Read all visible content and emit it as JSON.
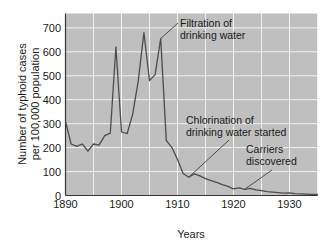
{
  "chart_data": {
    "type": "line",
    "title": "",
    "xlabel": "Years",
    "ylabel": "Number of typhoid cases per 100,000 population",
    "ylabel_line1": "Number of typhoid cases",
    "ylabel_line2": "per 100,000 population",
    "xlim": [
      1890,
      1935
    ],
    "ylim": [
      0,
      760
    ],
    "grid": true,
    "legend": "none",
    "background_color": "#bfbfbf",
    "gridline_color": "#f2f2f2",
    "line_color": "#4d4d4d",
    "axis_color": "#333333",
    "xticks": [
      1890,
      1900,
      1910,
      1920,
      1930
    ],
    "xtick_labels": [
      "1890",
      "1900",
      "1910",
      "1920",
      "1930"
    ],
    "yticks": [
      0,
      100,
      200,
      300,
      400,
      500,
      600,
      700
    ],
    "ytick_labels": [
      "0",
      "100",
      "200",
      "300",
      "400",
      "500",
      "600",
      "700"
    ],
    "x": [
      1890,
      1891,
      1892,
      1893,
      1894,
      1895,
      1896,
      1897,
      1898,
      1899,
      1900,
      1901,
      1902,
      1903,
      1904,
      1905,
      1906,
      1907,
      1908,
      1909,
      1910,
      1911,
      1912,
      1913,
      1914,
      1915,
      1916,
      1917,
      1918,
      1919,
      1920,
      1921,
      1922,
      1923,
      1924,
      1925,
      1926,
      1927,
      1928,
      1929,
      1930,
      1931,
      1932,
      1933,
      1934,
      1935
    ],
    "values": [
      310,
      215,
      205,
      215,
      185,
      215,
      210,
      250,
      260,
      620,
      265,
      258,
      340,
      480,
      680,
      480,
      505,
      655,
      230,
      200,
      150,
      92,
      76,
      90,
      82,
      70,
      62,
      55,
      45,
      38,
      28,
      32,
      26,
      30,
      24,
      20,
      16,
      14,
      12,
      10,
      11,
      8,
      7,
      6,
      5,
      4
    ],
    "annotations": [
      {
        "id": "filtration",
        "line1": "Filtration of",
        "line2": "drinking water",
        "points_to_year": 1907,
        "points_to_value": 655
      },
      {
        "id": "chlorination",
        "line1": "Chlorination of",
        "line2": "drinking water started",
        "points_to_year": 1912,
        "points_to_value": 76
      },
      {
        "id": "carriers",
        "line1": "Carriers",
        "line2": "discovered",
        "points_to_year": 1922,
        "points_to_value": 26
      }
    ]
  }
}
